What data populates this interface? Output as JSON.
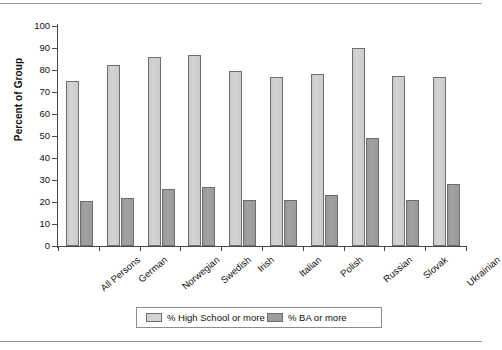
{
  "chart_data": {
    "type": "bar",
    "title": "",
    "xlabel": "",
    "ylabel": "Percent of Group",
    "ylim": [
      0,
      100
    ],
    "ytick_step": 10,
    "yticks": [
      0,
      10,
      20,
      30,
      40,
      50,
      60,
      70,
      80,
      90,
      100
    ],
    "grid": false,
    "legend_position": "bottom",
    "categories": [
      "All Persons",
      "German",
      "Norwegian",
      "Swedish",
      "Irish",
      "Italian",
      "Polish",
      "Russian",
      "Slovak",
      "Ukrainian"
    ],
    "series": [
      {
        "name": "% High School or more",
        "color": "#d2d2d2",
        "values": [
          75,
          82.5,
          86,
          87,
          79.5,
          77,
          78,
          90,
          77.5,
          77
        ]
      },
      {
        "name": "% BA or more",
        "color": "#9d9d9d",
        "values": [
          20.5,
          22,
          26,
          27,
          21,
          21,
          23,
          49,
          21,
          28
        ]
      }
    ]
  },
  "legend": {
    "items": [
      {
        "label": "% High School or more",
        "swatch": "hs"
      },
      {
        "label": "% BA or more",
        "swatch": "ba"
      }
    ]
  }
}
